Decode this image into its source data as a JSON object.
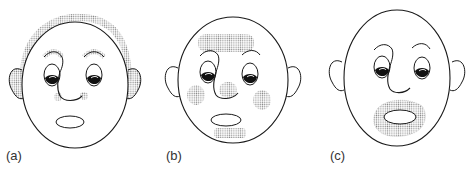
{
  "figure": {
    "panels": [
      {
        "id": "a",
        "label": "(a)",
        "shaded_regions": [
          "hair-outline-top-of-head",
          "ears",
          "eyebrows",
          "nose-sides"
        ]
      },
      {
        "id": "b",
        "label": "(b)",
        "shaded_regions": [
          "forehead",
          "cheeks",
          "nose-tip",
          "chin"
        ]
      },
      {
        "id": "c",
        "label": "(c)",
        "shaded_regions": [
          "mouth-surround-beard"
        ]
      }
    ],
    "colors": {
      "line": "#1a1a1a",
      "shading": "#9a9a9a",
      "background": "#ffffff"
    }
  }
}
